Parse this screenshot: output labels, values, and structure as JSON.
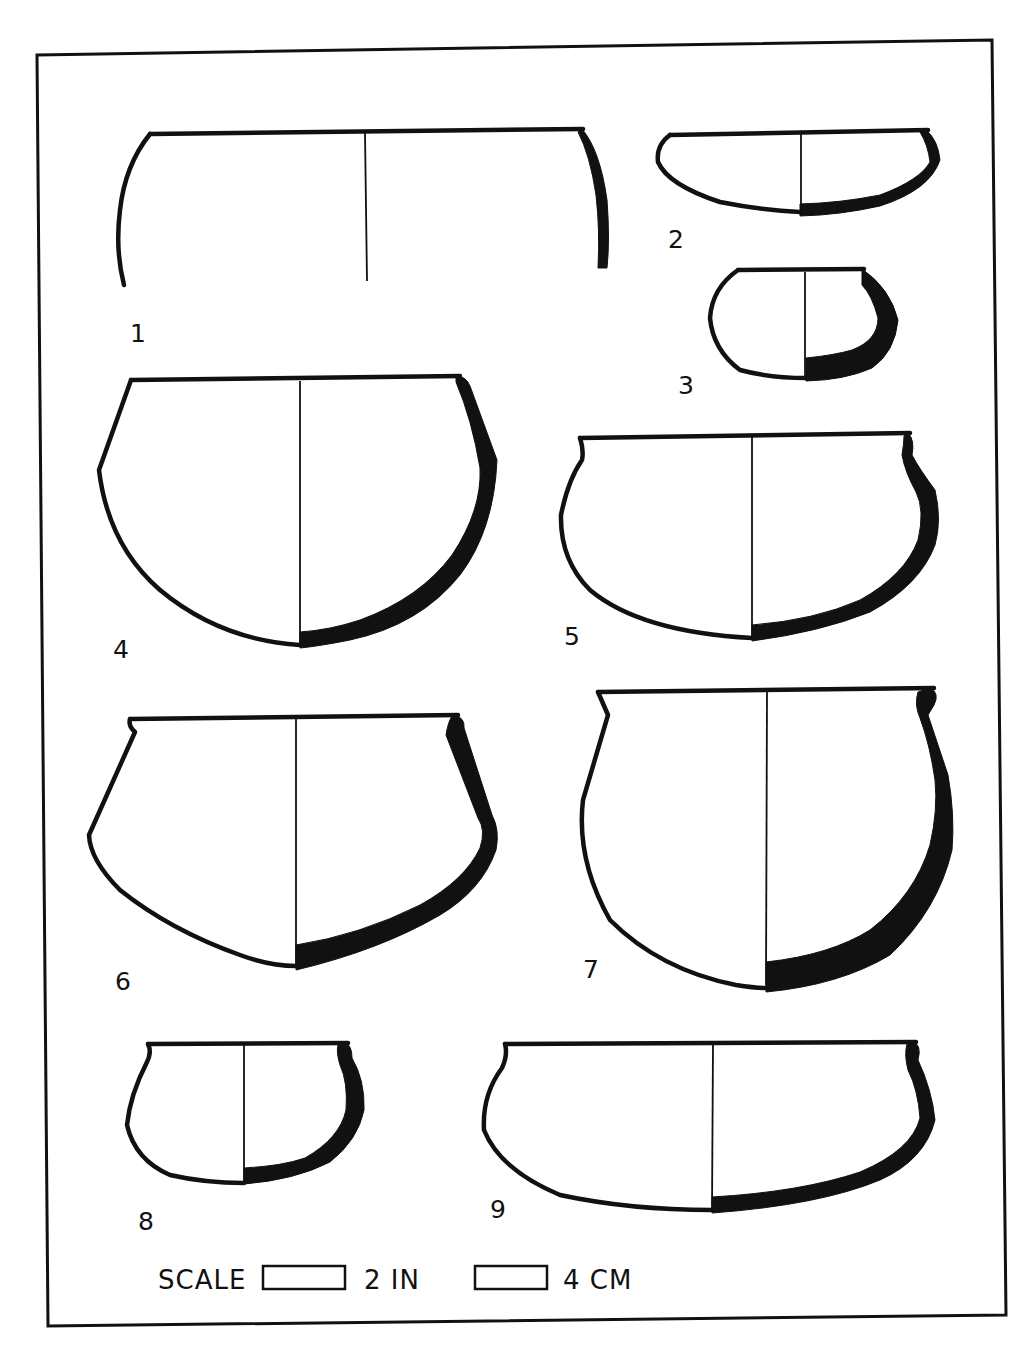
{
  "figure": {
    "type": "pottery-profile-plate",
    "frame_color": "#111111",
    "background": "#ffffff",
    "vessels": [
      {
        "id": 1,
        "label": "1",
        "form": "open cylindrical vessel rim fragment"
      },
      {
        "id": 2,
        "label": "2",
        "form": "shallow bowl"
      },
      {
        "id": 3,
        "label": "3",
        "form": "small incurved bowl"
      },
      {
        "id": 4,
        "label": "4",
        "form": "deep carinated bowl"
      },
      {
        "id": 5,
        "label": "5",
        "form": "bowl with everted rim"
      },
      {
        "id": 6,
        "label": "6",
        "form": "carinated bowl with everted rim"
      },
      {
        "id": 7,
        "label": "7",
        "form": "deep globular pot with everted rim"
      },
      {
        "id": 8,
        "label": "8",
        "form": "small globular pot"
      },
      {
        "id": 9,
        "label": "9",
        "form": "wide bowl with everted rim"
      }
    ]
  },
  "scale": {
    "label": "SCALE",
    "bars": [
      {
        "value": "2 IN"
      },
      {
        "value": "4 CM"
      }
    ]
  }
}
